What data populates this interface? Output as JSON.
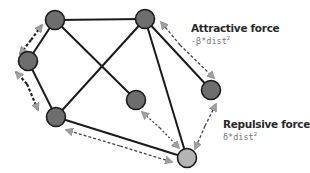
{
  "labels": {
    "attractive": {
      "title": "Attractive force",
      "formula_prefix": "-β*dist",
      "formula_exp": "2"
    },
    "repulsive": {
      "title": "Repulsive force",
      "formula_prefix": "δ*dist",
      "formula_exp": "2"
    }
  },
  "colors": {
    "node_fill": "#6e6e6e",
    "node_highlight_fill": "#b4b4b4",
    "node_stroke": "#1a1a1a",
    "edge": "#1a1a1a",
    "force_arrow": "#555555",
    "arrowhead": "#a0a0a0"
  },
  "nodes": [
    {
      "id": "n1",
      "x": 55,
      "y": 20
    },
    {
      "id": "n2",
      "x": 145,
      "y": 19
    },
    {
      "id": "n3",
      "x": 28,
      "y": 61
    },
    {
      "id": "n4",
      "x": 56,
      "y": 117
    },
    {
      "id": "n5",
      "x": 136,
      "y": 100
    },
    {
      "id": "n6",
      "x": 211,
      "y": 90
    },
    {
      "id": "n7",
      "x": 187,
      "y": 158,
      "highlight": true
    }
  ],
  "edges": [
    [
      "n1",
      "n2"
    ],
    [
      "n1",
      "n3"
    ],
    [
      "n1",
      "n5"
    ],
    [
      "n2",
      "n4"
    ],
    [
      "n2",
      "n7"
    ],
    [
      "n2",
      "n6"
    ],
    [
      "n3",
      "n4"
    ],
    [
      "n4",
      "n7"
    ]
  ],
  "force_arrows": [
    {
      "from": "n1",
      "to": "n3",
      "type": "attractive"
    },
    {
      "from": "n3",
      "to": "n4",
      "type": "repulsive"
    },
    {
      "from": "n2",
      "to": "n6",
      "type": "attractive"
    },
    {
      "from": "n5",
      "to": "n7",
      "type": "repulsive"
    },
    {
      "from": "n4",
      "to": "n7",
      "type": "repulsive"
    },
    {
      "from": "n6",
      "to": "n7",
      "type": "repulsive"
    }
  ]
}
